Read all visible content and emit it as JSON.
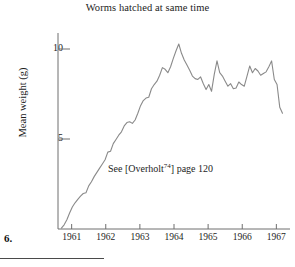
{
  "figure": {
    "number_label": "6.",
    "title": "Worms hatched at same time",
    "annotation_prefix": "See [Overholt",
    "annotation_superscript": "74",
    "annotation_suffix": "] page 120"
  },
  "chart_data": {
    "type": "line",
    "title": "Worms hatched at same time",
    "xlabel": "",
    "ylabel": "Mean weight (g)",
    "xlim": [
      1960.6,
      1967.4
    ],
    "ylim": [
      0,
      11.6
    ],
    "grid": false,
    "legend": null,
    "line_color": "#8a8a8a",
    "axis_color": "#6e6e6e",
    "x_tick_labels": [
      "1961",
      "1962",
      "1963",
      "1964",
      "1965",
      "1966",
      "1967"
    ],
    "x_tick_values": [
      1961,
      1962,
      1963,
      1964,
      1965,
      1966,
      1967
    ],
    "y_tick_labels": [
      "5",
      "10"
    ],
    "y_tick_values": [
      5,
      10
    ],
    "annotations": [
      {
        "text": "See [Overholt74] page 120",
        "x": 1963.2,
        "y": 3.5
      }
    ],
    "x": [
      1960.7,
      1960.78,
      1960.86,
      1960.94,
      1961.02,
      1961.1,
      1961.18,
      1961.26,
      1961.34,
      1961.42,
      1961.5,
      1961.58,
      1961.66,
      1961.74,
      1961.82,
      1961.9,
      1961.98,
      1962.06,
      1962.14,
      1962.22,
      1962.3,
      1962.38,
      1962.46,
      1962.54,
      1962.62,
      1962.7,
      1962.78,
      1962.86,
      1962.94,
      1963.02,
      1963.1,
      1963.18,
      1963.26,
      1963.34,
      1963.42,
      1963.5,
      1963.58,
      1963.66,
      1963.74,
      1963.82,
      1963.9,
      1963.98,
      1964.06,
      1964.14,
      1964.22,
      1964.3,
      1964.38,
      1964.46,
      1964.54,
      1964.62,
      1964.7,
      1964.78,
      1964.86,
      1964.94,
      1965.02,
      1965.1,
      1965.18,
      1965.26,
      1965.34,
      1965.42,
      1965.5,
      1965.58,
      1965.66,
      1965.74,
      1965.82,
      1965.9,
      1965.98,
      1966.06,
      1966.14,
      1966.22,
      1966.3,
      1966.38,
      1966.46,
      1966.54,
      1966.62,
      1966.7,
      1966.78,
      1966.86,
      1966.94,
      1967.02,
      1967.1,
      1967.18
    ],
    "y": [
      0.05,
      0.25,
      0.55,
      0.95,
      1.3,
      1.55,
      1.75,
      1.95,
      2.1,
      2.15,
      2.55,
      2.8,
      3.1,
      3.35,
      3.6,
      3.85,
      4.1,
      4.55,
      4.6,
      5.05,
      5.3,
      5.55,
      5.75,
      6.1,
      6.3,
      6.35,
      6.25,
      6.45,
      6.85,
      7.3,
      7.6,
      7.75,
      7.8,
      8.3,
      8.55,
      8.75,
      9.1,
      9.55,
      9.45,
      9.25,
      9.6,
      10.1,
      10.55,
      10.95,
      10.4,
      10.0,
      9.7,
      9.4,
      9.05,
      8.9,
      8.85,
      9.0,
      8.6,
      8.25,
      8.55,
      8.15,
      9.15,
      9.95,
      9.25,
      9.05,
      8.75,
      8.45,
      8.6,
      8.3,
      8.35,
      8.7,
      8.55,
      8.45,
      9.05,
      9.65,
      9.25,
      9.5,
      9.35,
      9.1,
      9.2,
      9.3,
      9.6,
      9.95,
      8.85,
      8.55,
      7.2,
      6.85
    ]
  }
}
